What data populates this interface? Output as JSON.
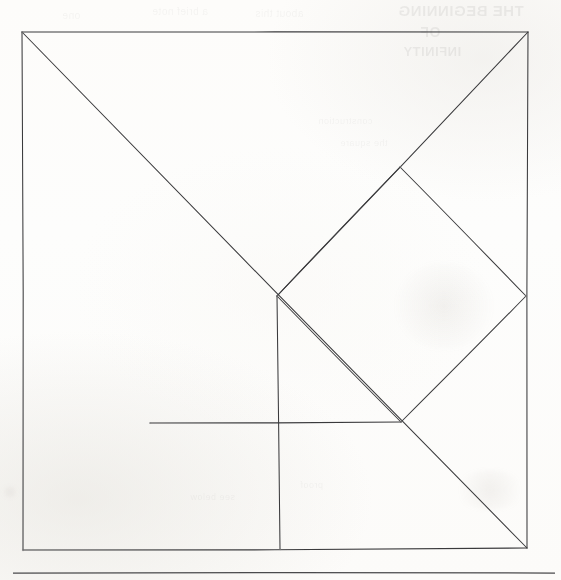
{
  "page": {
    "kind": "scanned-handdrawn-figure",
    "width": 561,
    "height": 580,
    "background_color": "#fdfdfc",
    "ink_color": "#3a3a3c"
  },
  "figure": {
    "name": "tangram-square",
    "outer_square": {
      "top_left": [
        22,
        32
      ],
      "top_right": [
        528,
        32
      ],
      "bottom_right": [
        527,
        548
      ],
      "bottom_left": [
        23,
        550
      ]
    },
    "center_point": [
      277,
      296
    ],
    "segments": [
      {
        "name": "outer-edge-top",
        "from": [
          22,
          32
        ],
        "to": [
          528,
          32
        ]
      },
      {
        "name": "outer-edge-right",
        "from": [
          528,
          32
        ],
        "to": [
          527,
          548
        ]
      },
      {
        "name": "outer-edge-bottom",
        "from": [
          527,
          548
        ],
        "to": [
          23,
          550
        ]
      },
      {
        "name": "outer-edge-left",
        "from": [
          23,
          550
        ],
        "to": [
          22,
          32
        ]
      },
      {
        "name": "main-diagonal",
        "from": [
          22,
          32
        ],
        "to": [
          527,
          548
        ]
      },
      {
        "name": "anti-diagonal-upper",
        "from": [
          528,
          32
        ],
        "to": [
          277,
          296
        ]
      },
      {
        "name": "anti-diagonal-lower",
        "from": [
          277,
          296
        ],
        "to": [
          280,
          549
        ]
      },
      {
        "name": "square-piece-upper-right",
        "from": [
          400,
          167
        ],
        "to": [
          526,
          296
        ]
      },
      {
        "name": "square-piece-upper-left",
        "from": [
          277,
          296
        ],
        "to": [
          400,
          167
        ]
      },
      {
        "name": "square-piece-lower-right",
        "from": [
          526,
          296
        ],
        "to": [
          401,
          422
        ]
      },
      {
        "name": "square-piece-lower-left",
        "from": [
          401,
          422
        ],
        "to": [
          277,
          296
        ]
      },
      {
        "name": "parallelogram-base",
        "from": [
          150,
          423
        ],
        "to": [
          401,
          422
        ]
      }
    ],
    "vertices": [
      {
        "name": "vertex-top-left",
        "at": [
          22,
          32
        ]
      },
      {
        "name": "vertex-top-right",
        "at": [
          528,
          32
        ]
      },
      {
        "name": "vertex-bottom-right",
        "at": [
          527,
          548
        ]
      },
      {
        "name": "vertex-bottom-left",
        "at": [
          23,
          550
        ]
      },
      {
        "name": "vertex-center",
        "at": [
          277,
          296
        ]
      },
      {
        "name": "vertex-square-top",
        "at": [
          400,
          167
        ]
      },
      {
        "name": "vertex-square-right",
        "at": [
          526,
          296
        ]
      },
      {
        "name": "vertex-square-bottom",
        "at": [
          401,
          422
        ]
      },
      {
        "name": "vertex-base-left",
        "at": [
          150,
          423
        ]
      },
      {
        "name": "vertex-bottom-mid",
        "at": [
          280,
          549
        ]
      }
    ],
    "pieces_count": 7
  },
  "rule_line": {
    "name": "bottom-horizontal-rule",
    "from": [
      13,
      573
    ],
    "to": [
      555,
      573
    ]
  },
  "bleed_through": {
    "note": "faint mirrored ink showing through from the reverse side of the sheet",
    "blocks": [
      {
        "text": "THE BEGINNING",
        "x": 398,
        "y": 2,
        "size": 15,
        "weight": "bold"
      },
      {
        "text": "OF",
        "x": 420,
        "y": 24,
        "size": 14,
        "weight": "bold"
      },
      {
        "text": "INFINITY",
        "x": 403,
        "y": 44,
        "size": 13,
        "weight": "bold"
      },
      {
        "text": "a brief note",
        "x": 152,
        "y": 6,
        "size": 10,
        "weight": "normal"
      },
      {
        "text": "about this",
        "x": 255,
        "y": 8,
        "size": 10,
        "weight": "normal"
      },
      {
        "text": "one",
        "x": 62,
        "y": 10,
        "size": 10,
        "weight": "normal"
      },
      {
        "text": "construction",
        "x": 318,
        "y": 116,
        "size": 9,
        "weight": "normal"
      },
      {
        "text": "the square",
        "x": 340,
        "y": 138,
        "size": 9,
        "weight": "normal"
      },
      {
        "text": "proof",
        "x": 300,
        "y": 480,
        "size": 9,
        "weight": "normal"
      },
      {
        "text": "see below",
        "x": 190,
        "y": 492,
        "size": 9,
        "weight": "normal"
      }
    ],
    "smudges": [
      {
        "x": 395,
        "y": 262,
        "w": 98,
        "h": 88
      },
      {
        "x": 2,
        "y": 486,
        "w": 16,
        "h": 12
      },
      {
        "x": 455,
        "y": 470,
        "w": 70,
        "h": 40
      }
    ]
  }
}
